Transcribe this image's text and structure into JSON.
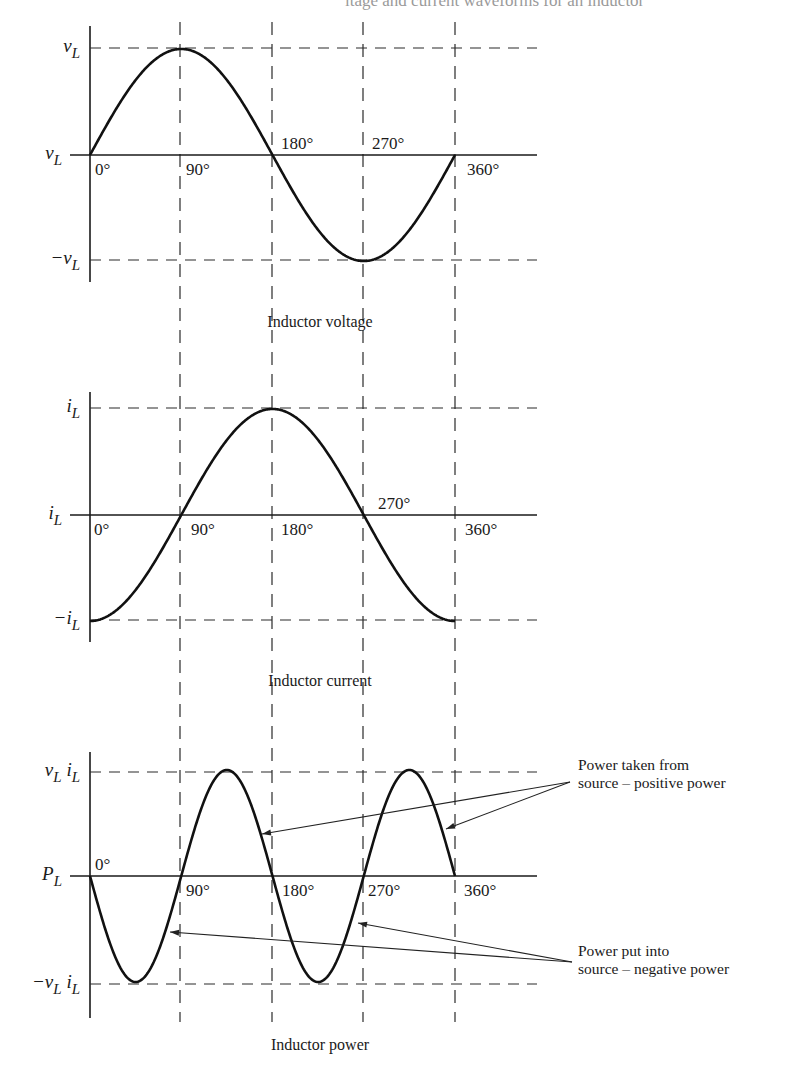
{
  "figure": {
    "title_visible_fragment": "ltage and current waveforms for an inductor",
    "degree_lines": [
      {
        "deg": 90,
        "x": 180
      },
      {
        "deg": 180,
        "x": 272
      },
      {
        "deg": 270,
        "x": 363
      },
      {
        "deg": 360,
        "x": 455
      }
    ],
    "x_origin": 90,
    "x_axis_end": 537
  },
  "panels": [
    {
      "id": "voltage",
      "caption": "Inductor voltage",
      "function": "sin",
      "y_top": 48,
      "y_zero": 155,
      "y_bottom": 260,
      "axis_top": 26,
      "axis_bottom": 282,
      "labels": {
        "top": {
          "base": "v",
          "sub": "L",
          "prefix": ""
        },
        "zero": {
          "base": "v",
          "sub": "L",
          "prefix": ""
        },
        "bottom": {
          "base": "v",
          "sub": "L",
          "prefix": "−"
        }
      },
      "degree_labels": [
        {
          "text": "0°",
          "x": 95,
          "pos": "below"
        },
        {
          "text": "90°",
          "x": 186,
          "pos": "below"
        },
        {
          "text": "180°",
          "x": 281,
          "pos": "above"
        },
        {
          "text": "270°",
          "x": 372,
          "pos": "above"
        },
        {
          "text": "360°",
          "x": 467,
          "pos": "below"
        }
      ],
      "caption_y": 327
    },
    {
      "id": "current",
      "caption": "Inductor current",
      "function": "negcos",
      "y_top": 408,
      "y_zero": 515,
      "y_bottom": 620,
      "axis_top": 392,
      "axis_bottom": 642,
      "labels": {
        "top": {
          "base": "i",
          "sub": "L",
          "prefix": ""
        },
        "zero": {
          "base": "i",
          "sub": "L",
          "prefix": ""
        },
        "bottom": {
          "base": "i",
          "sub": "L",
          "prefix": "−"
        }
      },
      "degree_labels": [
        {
          "text": "0°",
          "x": 94,
          "pos": "below"
        },
        {
          "text": "90°",
          "x": 191,
          "pos": "below"
        },
        {
          "text": "180°",
          "x": 281,
          "pos": "below"
        },
        {
          "text": "270°",
          "x": 378,
          "pos": "above"
        },
        {
          "text": "360°",
          "x": 465,
          "pos": "below"
        }
      ],
      "caption_y": 686
    },
    {
      "id": "power",
      "caption": "Inductor power",
      "function": "negsin2",
      "y_top": 772,
      "y_zero": 876,
      "y_bottom": 984,
      "axis_top": 752,
      "axis_bottom": 1018,
      "labels": {
        "top": {
          "base": "v",
          "sub": "L",
          "base2": "i",
          "sub2": "L",
          "prefix": ""
        },
        "zero": {
          "base": "P",
          "sub": "L",
          "prefix": ""
        },
        "bottom": {
          "base": "v",
          "sub": "L",
          "base2": "i",
          "sub2": "L",
          "prefix": "−"
        }
      },
      "degree_labels": [
        {
          "text": "0°",
          "x": 95,
          "pos": "above"
        },
        {
          "text": "90°",
          "x": 186,
          "pos": "below"
        },
        {
          "text": "180°",
          "x": 282,
          "pos": "below"
        },
        {
          "text": "270°",
          "x": 368,
          "pos": "below"
        },
        {
          "text": "360°",
          "x": 464,
          "pos": "below"
        }
      ],
      "caption_y": 1050,
      "annotations": [
        {
          "lines": [
            "Power taken from",
            "source – positive power"
          ],
          "text_x": 578,
          "text_y": 776,
          "tail": [
            570,
            782
          ],
          "tips": [
            [
              262,
              834
            ],
            [
              446,
              829
            ]
          ]
        },
        {
          "lines": [
            "Power put into",
            "source – negative power"
          ],
          "text_x": 578,
          "text_y": 962,
          "tail": [
            572,
            962
          ],
          "tips": [
            [
              170,
              932
            ],
            [
              358,
              923
            ]
          ]
        }
      ]
    }
  ],
  "chart_data": {
    "type": "line",
    "x": [
      0,
      90,
      180,
      270,
      360
    ],
    "xlabel": "Phase angle (degrees)",
    "series": [
      {
        "name": "Inductor voltage",
        "values": [
          0,
          1,
          0,
          -1,
          0
        ],
        "ytick_labels": [
          "vL",
          "vL",
          "-vL"
        ]
      },
      {
        "name": "Inductor current",
        "values": [
          -1,
          0,
          1,
          0,
          -1
        ],
        "ytick_labels": [
          "iL",
          "iL",
          "-iL"
        ]
      },
      {
        "name": "Inductor power",
        "values": [
          0,
          0,
          0,
          0,
          0
        ],
        "peaks": {
          "45": -1,
          "135": 1,
          "225": -1,
          "315": 1
        },
        "ytick_labels": [
          "vL iL",
          "PL",
          "-vL iL"
        ]
      }
    ],
    "annotations": [
      "Power taken from source – positive power",
      "Power put into source – negative power"
    ],
    "grid": "dashed reference lines at 90/180/270/360 degrees and at peak values"
  }
}
